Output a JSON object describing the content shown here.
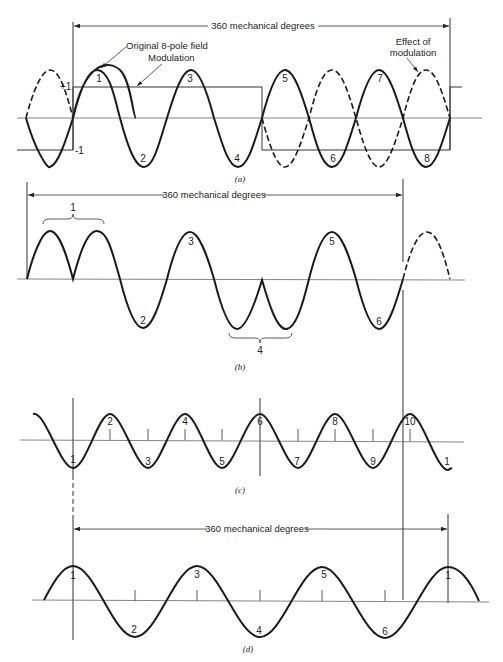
{
  "figure": {
    "panel_a": {
      "caption": "(a)",
      "span_label": "360 mechanical degrees",
      "annotation_original": "Original 8-pole field",
      "annotation_modulation": "Modulation",
      "annotation_effect_line1": "Effect of",
      "annotation_effect_line2": "modulation",
      "plus_one": "+1",
      "minus_one": "-1",
      "pole_labels": [
        "1",
        "2",
        "3",
        "4",
        "5",
        "6",
        "7",
        "8"
      ]
    },
    "panel_b": {
      "caption": "(b)",
      "span_label": "360 mechanical degrees",
      "pole_labels": [
        "1",
        "2",
        "3",
        "4",
        "5",
        "6"
      ]
    },
    "panel_c": {
      "caption": "(c)",
      "pole_labels": [
        "1",
        "2",
        "3",
        "4",
        "5",
        "6",
        "7",
        "8",
        "9",
        "10",
        "1"
      ]
    },
    "panel_d": {
      "caption": "(d)",
      "span_label": "360 mechanical degrees",
      "pole_labels": [
        "1",
        "2",
        "3",
        "4",
        "5",
        "6",
        "1"
      ]
    }
  },
  "colors": {
    "ink": "#1a1a1a",
    "axis": "#555555",
    "background": "#ffffff"
  }
}
